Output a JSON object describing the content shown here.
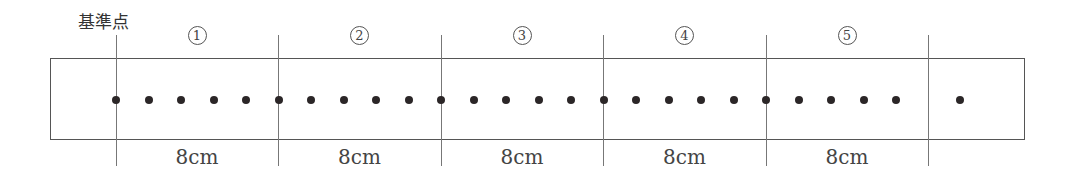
{
  "title": "基準点",
  "box": {
    "left": 50,
    "top": 58,
    "right": 1025,
    "bottom": 140
  },
  "reference_lines_x": [
    116,
    278,
    441,
    603,
    766,
    928
  ],
  "segments": [
    {
      "label": "1",
      "distance": "8cm"
    },
    {
      "label": "2",
      "distance": "8cm"
    },
    {
      "label": "3",
      "distance": "8cm"
    },
    {
      "label": "4",
      "distance": "8cm"
    },
    {
      "label": "5",
      "distance": "8cm"
    }
  ],
  "dots": {
    "count": 27,
    "start_x": 116,
    "spacing": 32.5,
    "regular_count": 25,
    "extra_x": [
      960
    ]
  },
  "colors": {
    "dot": "#2b2627",
    "line": "#777777",
    "border": "#555555"
  }
}
